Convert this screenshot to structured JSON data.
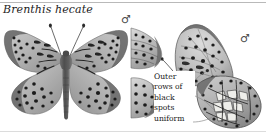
{
  "plate": {
    "species_name": "Brenthis hecate",
    "background_color": "#ffffff",
    "rule_color_top": "#b9b9b9",
    "rule_color_bottom": "#dcdcdc"
  },
  "specimens": [
    {
      "id": "left-dorsal",
      "sex_symbol": "♂",
      "view": "dorsal",
      "description": "spread-wing grayscale butterfly specimen, wings open"
    },
    {
      "id": "right-ventral",
      "sex_symbol": "♂",
      "view": "ventral",
      "description": "side view butterfly specimen with folded wings"
    }
  ],
  "annotations": [
    {
      "id": "outer-rows-callout",
      "lines": [
        "Outer",
        "rows of",
        "black",
        "spots",
        "uniform"
      ],
      "text": "Outer rows of black spots uniform",
      "leader_count": 3
    }
  ],
  "colors": {
    "wing_light": "#d8d8d8",
    "wing_mid": "#a8a8a8",
    "wing_dark": "#6a6a6a",
    "spot_black": "#1d1d1d",
    "body_dark": "#555555",
    "leader_line": "#8a8a8a",
    "text": "#1a1a1a"
  }
}
